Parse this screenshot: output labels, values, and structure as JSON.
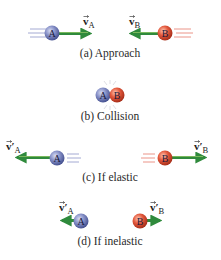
{
  "diagram": {
    "type": "collision-stages",
    "colors": {
      "ball_a": "#7c88c4",
      "ball_a_dark": "#3e4a8a",
      "ball_b": "#e0553c",
      "ball_b_dark": "#a82a18",
      "arrow": "#2f8a3c",
      "arrow_highlight": "#9acb6a",
      "motion_lines_a": "#8e96c8",
      "motion_lines_b": "#e67a6a",
      "caption": "#2a2a2a"
    },
    "panels": [
      {
        "id": "a",
        "caption": "(a) Approach",
        "ball_a": {
          "label": "A"
        },
        "ball_b": {
          "label": "B"
        },
        "vector_a": {
          "symbol": "v",
          "subscript": "A",
          "prime": "",
          "direction": "right"
        },
        "vector_b": {
          "symbol": "v",
          "subscript": "B",
          "prime": "",
          "direction": "left"
        }
      },
      {
        "id": "b",
        "caption": "(b) Collision",
        "ball_a": {
          "label": "A"
        },
        "ball_b": {
          "label": "B"
        }
      },
      {
        "id": "c",
        "caption": "(c) If elastic",
        "ball_a": {
          "label": "A"
        },
        "ball_b": {
          "label": "B"
        },
        "vector_a": {
          "symbol": "v",
          "subscript": "A",
          "prime": "′",
          "direction": "left"
        },
        "vector_b": {
          "symbol": "v",
          "subscript": "B",
          "prime": "′",
          "direction": "right"
        }
      },
      {
        "id": "d",
        "caption": "(d) If inelastic",
        "ball_a": {
          "label": "A"
        },
        "ball_b": {
          "label": "B"
        },
        "vector_a": {
          "symbol": "v",
          "subscript": "A",
          "prime": "′",
          "direction": "left"
        },
        "vector_b": {
          "symbol": "v",
          "subscript": "B",
          "prime": "′",
          "direction": "right"
        }
      }
    ]
  }
}
